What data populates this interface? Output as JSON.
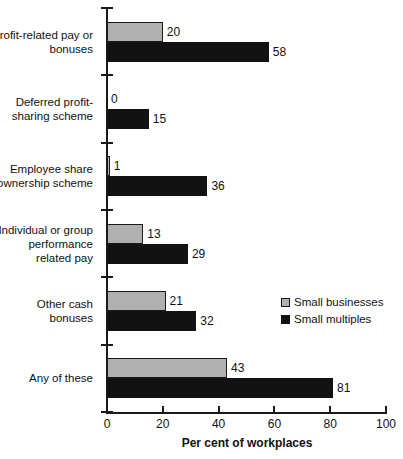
{
  "chart_data": {
    "type": "bar",
    "orientation": "horizontal",
    "title": "",
    "xlabel": "Per cent of workplaces",
    "ylabel": "",
    "xlim": [
      0,
      100
    ],
    "xticks": [
      0,
      20,
      40,
      60,
      80,
      100
    ],
    "grid": false,
    "legend_position": "middle-right",
    "categories": [
      "Profit-related pay or bonuses",
      "Deferred profit-sharing scheme",
      "Employee share ownership scheme",
      "Individual or group performance related pay",
      "Other cash bonuses",
      "Any of these"
    ],
    "category_lines": [
      [
        "Profit-related pay or",
        "bonuses"
      ],
      [
        "Deferred profit-",
        "sharing scheme"
      ],
      [
        "Employee share",
        "ownership scheme"
      ],
      [
        "Individual or group",
        "performance",
        "related pay"
      ],
      [
        "Other cash",
        "bonuses"
      ],
      [
        "Any of these"
      ]
    ],
    "series": [
      {
        "name": "Small businesses",
        "color": "#b0b0b0",
        "values": [
          20,
          0,
          1,
          13,
          21,
          43
        ]
      },
      {
        "name": "Small multiples",
        "color": "#121212",
        "values": [
          58,
          15,
          36,
          29,
          32,
          81
        ]
      }
    ]
  },
  "axis": {
    "x_title": "Per cent of workplaces",
    "tick_labels": [
      "0",
      "20",
      "40",
      "60",
      "80",
      "100"
    ]
  },
  "legend": {
    "items": [
      {
        "label": "Small businesses",
        "swatch": "light"
      },
      {
        "label": "Small multiples",
        "swatch": "dark"
      }
    ]
  }
}
